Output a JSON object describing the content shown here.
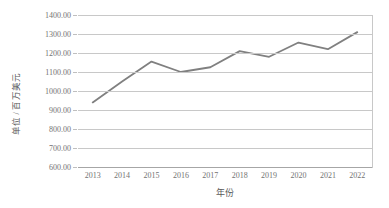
{
  "chart_data": {
    "type": "line",
    "title": "",
    "subtitle": "",
    "xlabel": "年份",
    "ylabel": "单位 / 百万美元",
    "categories": [
      "2013",
      "2014",
      "2015",
      "2016",
      "2017",
      "2018",
      "2019",
      "2020",
      "2021",
      "2022"
    ],
    "values": [
      940,
      1050,
      1155,
      1100,
      1125,
      1210,
      1180,
      1255,
      1220,
      1310
    ],
    "series": [
      {
        "name": "",
        "values": [
          940,
          1050,
          1155,
          1100,
          1125,
          1210,
          1180,
          1255,
          1220,
          1310
        ]
      }
    ],
    "ylim": [
      600,
      1400
    ],
    "ytick_step": 100,
    "ytick_labels": [
      "1400.00",
      "1300.00",
      "1200.00",
      "1100.00",
      "1000.00",
      "900.00",
      "800.00",
      "700.00",
      "600.00"
    ],
    "ytick_values": [
      1400,
      1300,
      1200,
      1100,
      1000,
      900,
      800,
      700,
      600
    ],
    "xtick_labels": [
      "2013",
      "2014",
      "2015",
      "2016",
      "2017",
      "2018",
      "2019",
      "2020",
      "2021",
      "2022"
    ],
    "grid": "horizontal",
    "legend": "none",
    "line_color": "#808080",
    "grid_color": "#c8c8c8",
    "axis_color": "#a6a6a6",
    "text_color": "#737373",
    "background_color": "#ffffff"
  }
}
